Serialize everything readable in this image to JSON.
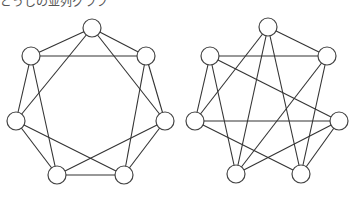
{
  "caption": "どうしの並列グラフ",
  "graphs": [
    {
      "name": "left-graph",
      "nodes": [
        [
          92,
          28
        ],
        [
          146,
          56
        ],
        [
          165,
          121
        ],
        [
          124,
          175
        ],
        [
          57,
          175
        ],
        [
          16,
          121
        ],
        [
          31,
          56
        ]
      ],
      "edges": [
        [
          0,
          1
        ],
        [
          1,
          2
        ],
        [
          2,
          3
        ],
        [
          3,
          4
        ],
        [
          4,
          5
        ],
        [
          5,
          6
        ],
        [
          6,
          0
        ],
        [
          0,
          2
        ],
        [
          1,
          3
        ],
        [
          2,
          4
        ],
        [
          3,
          5
        ],
        [
          4,
          6
        ],
        [
          5,
          0
        ],
        [
          6,
          1
        ]
      ]
    },
    {
      "name": "right-graph",
      "nodes": [
        [
          268,
          27
        ],
        [
          327,
          56
        ],
        [
          339,
          121
        ],
        [
          301,
          174
        ],
        [
          236,
          174
        ],
        [
          195,
          121
        ],
        [
          210,
          56
        ]
      ],
      "edges": [
        [
          0,
          1
        ],
        [
          0,
          5
        ],
        [
          0,
          4
        ],
        [
          0,
          3
        ],
        [
          6,
          1
        ],
        [
          6,
          5
        ],
        [
          6,
          4
        ],
        [
          6,
          2
        ],
        [
          1,
          4
        ],
        [
          1,
          3
        ],
        [
          5,
          2
        ],
        [
          5,
          3
        ],
        [
          2,
          4
        ],
        [
          2,
          3
        ]
      ]
    }
  ],
  "node_radius": 9
}
